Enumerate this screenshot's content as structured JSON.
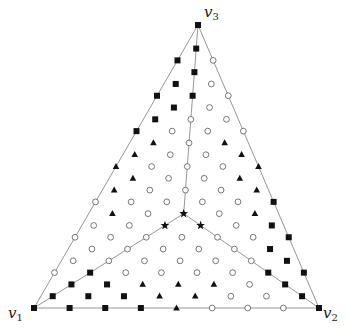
{
  "diagram": {
    "subdivision": 24,
    "vertices": {
      "v1": {
        "label": "v",
        "sub": "1"
      },
      "v2": {
        "label": "v",
        "sub": "2"
      },
      "v3": {
        "label": "v",
        "sub": "3"
      }
    },
    "marker_legend": {
      "S": "filled-square",
      "T": "filled-triangle",
      "O": "open-circle",
      "X": "filled-star"
    },
    "center_lines": [
      {
        "from": "v1",
        "to": "center"
      },
      {
        "from": "v2",
        "to": "center"
      },
      {
        "from": "v3",
        "to": "center"
      }
    ],
    "rows": [
      {
        "c": 24,
        "markers": "S"
      },
      {
        "c": 22,
        "markers": "S"
      },
      {
        "c": 21,
        "markers": "SO"
      },
      {
        "c": 20,
        "markers": "S"
      },
      {
        "c": 19,
        "markers": "SO"
      },
      {
        "c": 18,
        "markers": "SSO"
      },
      {
        "c": 17,
        "markers": "SO"
      },
      {
        "c": 16,
        "markers": "SOO"
      },
      {
        "c": 15,
        "markers": "SOOO"
      },
      {
        "c": 14,
        "markers": "TOT"
      },
      {
        "c": 13,
        "markers": "TOOT"
      },
      {
        "c": 12,
        "markers": "TOOOT"
      },
      {
        "c": 11,
        "markers": "TOOT"
      },
      {
        "c": 10,
        "markers": "TOOOT"
      },
      {
        "c": 9,
        "markers": "OOOOOS"
      },
      {
        "c": 8,
        "markers": "TOXOT"
      },
      {
        "c": 7,
        "markers": "OOXXOS"
      },
      {
        "c": 6,
        "markers": "OOOOOOS"
      },
      {
        "c": 5,
        "markers": "OOOOOS"
      },
      {
        "c": 4,
        "markers": "OOOOOOS"
      },
      {
        "c": 3,
        "markers": "OSOOOOSS"
      },
      {
        "c": 2,
        "markers": "SSTTTOS"
      },
      {
        "c": 1,
        "markers": "SSSTTOOS"
      },
      {
        "c": 0,
        "markers": "SSSSTOOOS"
      }
    ],
    "colors": {
      "edge": "#8a8a8a",
      "marker": "#111111",
      "open_marker_stroke": "#555555"
    }
  }
}
